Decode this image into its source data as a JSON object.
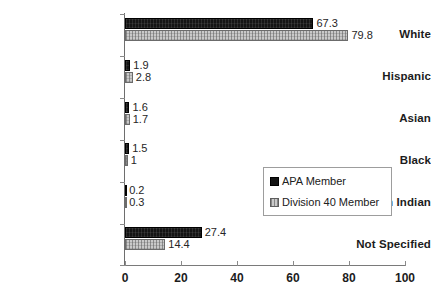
{
  "chart_data": {
    "type": "bar",
    "orientation": "horizontal",
    "title": "",
    "xlabel": "",
    "ylabel": "",
    "xlim": [
      0,
      100
    ],
    "xticks": [
      0,
      20,
      40,
      60,
      80,
      100
    ],
    "xtick_labels": [
      "0",
      "20",
      "40",
      "60",
      "80",
      "100"
    ],
    "grid": false,
    "legend_position": "center-right",
    "categories": [
      "White",
      "Hispanic",
      "Asian",
      "Black",
      "American Indian",
      "Not Specified"
    ],
    "series": [
      {
        "name": "APA Member",
        "color": "#141414",
        "values": [
          67.3,
          1.9,
          1.6,
          1.5,
          0.2,
          27.4
        ],
        "value_labels": [
          "67.3",
          "1.9",
          "1.6",
          "1.5",
          "0.2",
          "27.4"
        ]
      },
      {
        "name": "Division 40 Member",
        "color": "#c9c9c9",
        "values": [
          79.8,
          2.8,
          1.7,
          1,
          0.3,
          14.4
        ],
        "value_labels": [
          "79.8",
          "2.8",
          "1.7",
          "1",
          "0.3",
          "14.4"
        ]
      }
    ]
  },
  "legend": {
    "items": [
      {
        "label": "APA Member",
        "swatch": "black-square-swatch"
      },
      {
        "label": "Division 40 Member",
        "swatch": "gray-patterned-square-swatch"
      }
    ]
  }
}
